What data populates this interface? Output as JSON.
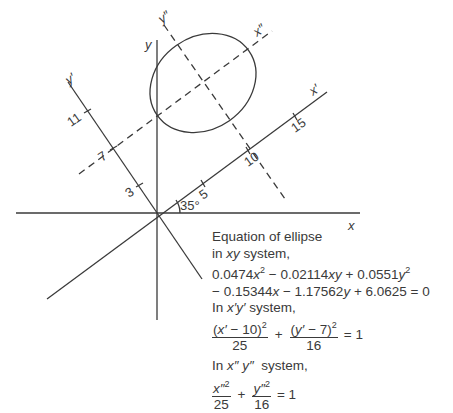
{
  "figure": {
    "type": "coordinate-rotation-diagram",
    "axes": {
      "x": "x",
      "y": "y",
      "x_prime": "x′",
      "y_prime": "y′",
      "x_double_prime": "x″",
      "y_double_prime": "y″"
    },
    "angle_label": "35°",
    "ticks": {
      "x_prime": [
        "5",
        "10",
        "15"
      ],
      "y_prime": [
        "3",
        "7",
        "11"
      ]
    },
    "colors": {
      "line": "#3a3a3a",
      "background": "#ffffff"
    }
  },
  "equations": {
    "heading_line1": "Equation of ellipse",
    "heading_line2_pre": "in ",
    "heading_line2_var": "xy",
    "heading_line2_post": " system,",
    "xy_line1": {
      "t1": "0.0474",
      "t1v": "x",
      "t2": " − 0.02114",
      "t2v": "xy",
      "t3": " + 0.0551",
      "t3v": "y"
    },
    "xy_line2": {
      "t1": "− 0.15344",
      "t1v": "x",
      "t2": " − 1.17562",
      "t2v": "y",
      "t3": " + 6.0625 = 0"
    },
    "prime_heading_pre": "In ",
    "prime_heading_var": "x′y′",
    "prime_heading_post": " system,",
    "prime_eq": {
      "num1_open": "(",
      "num1_var": "x′",
      "num1_rest": " − 10)",
      "den1": "25",
      "plus": "+",
      "num2_open": "(",
      "num2_var": "y′",
      "num2_rest": " − 7)",
      "den2": "16",
      "equals": "= 1"
    },
    "dprime_heading_pre": "In ",
    "dprime_heading_var": "x″ y″",
    "dprime_heading_post": "  system,",
    "dprime_eq": {
      "num1_var": "x″",
      "den1": "25",
      "plus": "+",
      "num2_var": "y″",
      "den2": "16",
      "equals": "= 1"
    },
    "exp": "2"
  }
}
